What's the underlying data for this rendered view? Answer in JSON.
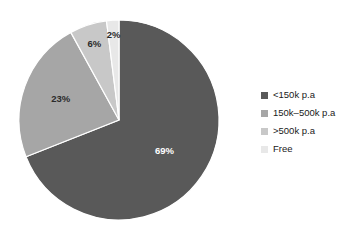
{
  "chart_data": {
    "type": "pie",
    "title": "",
    "categories": [
      "<150k p.a",
      "150k–500k p.a",
      ">500k p.a",
      "Free"
    ],
    "values": [
      69,
      23,
      6,
      2
    ],
    "value_labels": [
      "69%",
      "23%",
      "6%",
      "2%"
    ],
    "colors": [
      "#595959",
      "#a6a6a6",
      "#c8c8c8",
      "#e8e8e8"
    ],
    "legend_position": "right",
    "start_angle": 0,
    "direction": "clockwise",
    "units": "percent",
    "background": "#ffffff"
  },
  "legend": {
    "items": [
      {
        "label": "<150k p.a",
        "color": "#595959"
      },
      {
        "label": "150k–500k p.a",
        "color": "#a6a6a6"
      },
      {
        "label": ">500k p.a",
        "color": "#c8c8c8"
      },
      {
        "label": "Free",
        "color": "#e8e8e8"
      }
    ]
  },
  "slice_labels": {
    "s0": "69%",
    "s1": "23%",
    "s2": "6%",
    "s3": "2%"
  }
}
